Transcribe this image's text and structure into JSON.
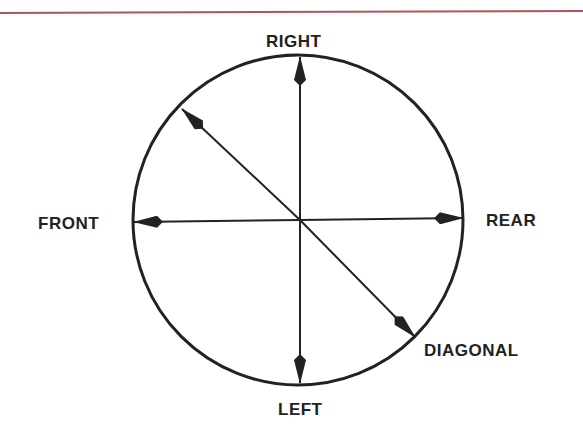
{
  "header": {
    "rule_color": "#b4525c"
  },
  "diagram": {
    "type": "direction-of-motion",
    "circle": {
      "cx": 298,
      "cy": 220,
      "r": 165,
      "stroke": "#222222"
    },
    "labels": {
      "top": "RIGHT",
      "bottom": "LEFT",
      "left": "FRONT",
      "right": "REAR",
      "diagonal": "DIAGONAL"
    },
    "arrows": [
      {
        "name": "right",
        "direction": "up"
      },
      {
        "name": "left",
        "direction": "down"
      },
      {
        "name": "front",
        "direction": "left"
      },
      {
        "name": "rear",
        "direction": "right"
      },
      {
        "name": "diagonal-upper",
        "direction": "up-left"
      },
      {
        "name": "diagonal-lower",
        "direction": "down-right"
      }
    ]
  }
}
